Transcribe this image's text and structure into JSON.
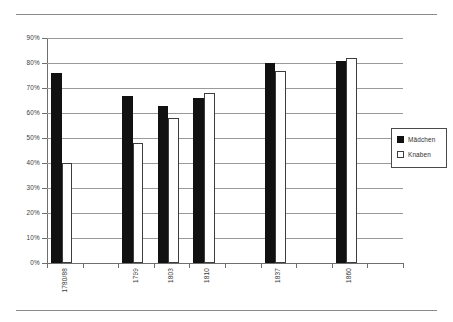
{
  "chart_data": {
    "type": "bar",
    "title": "",
    "xlabel": "",
    "ylabel": "",
    "categories": [
      "1780/88",
      "1799",
      "1803",
      "1810",
      "1837",
      "1860"
    ],
    "series": [
      {
        "name": "Mädchen",
        "values": [
          76,
          67,
          63,
          66,
          80,
          81
        ],
        "color": "#111111"
      },
      {
        "name": "Knaben",
        "values": [
          40,
          48,
          58,
          68,
          77,
          82
        ],
        "color": "#ffffff"
      }
    ],
    "ylim": [
      0,
      90
    ],
    "ytick_values": [
      0,
      10,
      20,
      30,
      40,
      50,
      60,
      70,
      80,
      90
    ],
    "ytick_labels": [
      "0%",
      "10%",
      "20%",
      "30%",
      "40%",
      "50%",
      "60%",
      "70%",
      "80%",
      "90%"
    ],
    "grid": true,
    "legend_position": "right",
    "legend_entries": [
      "Mädchen",
      "Knaben"
    ],
    "x_slot_count": 10,
    "x_slot_index_for_category": [
      0,
      2,
      3,
      4,
      6,
      8
    ]
  },
  "legend": {
    "items": [
      {
        "label": "Mädchen",
        "swatch": "filled-square-icon"
      },
      {
        "label": "Knaben",
        "swatch": "hollow-square-icon"
      }
    ]
  }
}
